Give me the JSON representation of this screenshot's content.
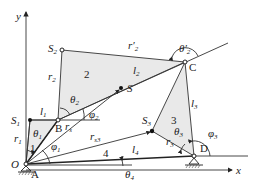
{
  "diagram": {
    "axes": {
      "x_label": "x",
      "y_label": "y",
      "origin_label": "O"
    },
    "points": {
      "A": "A",
      "B": "B",
      "C": "C",
      "D": "D",
      "S": "S",
      "S1": "S",
      "S1_sub": "1",
      "S2": "S",
      "S2_sub": "2",
      "S3": "S",
      "S3_sub": "3"
    },
    "links": {
      "link1": "1",
      "link2": "2",
      "link3": "3",
      "link4": "4"
    },
    "lengths": {
      "l1": "l",
      "l1_sub": "1",
      "l2": "l",
      "l2_sub": "2",
      "l3": "l",
      "l3_sub": "3",
      "l4": "l",
      "l4_sub": "4",
      "r1": "r",
      "r1_sub": "1",
      "r2": "r",
      "r2_sub": "2",
      "r2p": "r′",
      "r2p_sub": "2",
      "r3": "r",
      "r3_sub": "3",
      "rs": "r",
      "rs_sub": "s",
      "rs3": "r",
      "rs3_sub": "s3"
    },
    "angles": {
      "theta1": "θ",
      "theta1_sub": "1",
      "theta2": "θ",
      "theta2_sub": "2",
      "theta2p": "θ′",
      "theta2p_sub": "2",
      "theta3": "θ",
      "theta3_sub": "3",
      "theta4": "θ",
      "theta4_sub": "4",
      "phi1": "φ",
      "phi1_sub": "1",
      "phi2": "φ",
      "phi2_sub": "2",
      "phi3": "φ",
      "phi3_sub": "3"
    },
    "colors": {
      "line": "#333333",
      "fill": "#e9e9e9",
      "background": "#ffffff"
    }
  }
}
